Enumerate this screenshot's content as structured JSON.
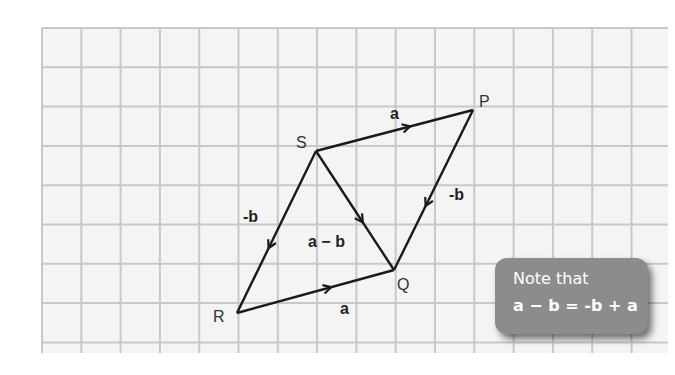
{
  "diagram": {
    "grid": {
      "left": 42,
      "top": 28,
      "right": 668,
      "bottom": 353,
      "cell": 39.3,
      "line_color": "#c8c8c8",
      "bg": "#f4f4f4"
    },
    "points": {
      "S": {
        "label": "S",
        "x": 316,
        "y": 151
      },
      "P": {
        "label": "P",
        "x": 473,
        "y": 110
      },
      "Q": {
        "label": "Q",
        "x": 394,
        "y": 270
      },
      "R": {
        "label": "R",
        "x": 237,
        "y": 313
      }
    },
    "vectors": [
      {
        "id": "SP",
        "from": "S",
        "to": "P",
        "label": "a"
      },
      {
        "id": "RQ",
        "from": "R",
        "to": "Q",
        "label": "a"
      },
      {
        "id": "PQ",
        "from": "P",
        "to": "Q",
        "label": "-b"
      },
      {
        "id": "SR",
        "from": "S",
        "to": "R",
        "label": "-b"
      },
      {
        "id": "SQ",
        "from": "S",
        "to": "Q",
        "label": "a − b"
      }
    ],
    "labels": {
      "S": "S",
      "P": "P",
      "Q": "Q",
      "R": "R",
      "a_top": "a",
      "a_bottom": "a",
      "neg_b_left": "-b",
      "neg_b_right": "-b",
      "a_minus_b": "a − b"
    },
    "note": {
      "line1": "Note that",
      "line2": "a − b = -b + a",
      "bg": "#8c8c8c",
      "text_color": "#ffffff"
    },
    "colors": {
      "line": "#1a1a1a",
      "label": "#333333"
    }
  }
}
